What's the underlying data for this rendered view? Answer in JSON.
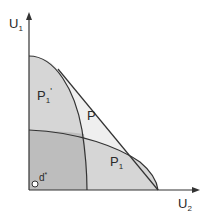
{
  "diagram": {
    "axes": {
      "y_label": "U",
      "y_sub": "1",
      "x_label": "U",
      "x_sub": "2"
    },
    "regions": {
      "p1_prime": {
        "label": "P",
        "sub": "1",
        "sup": "'"
      },
      "p": {
        "label": "P"
      },
      "p1": {
        "label": "P",
        "sub": "1"
      }
    },
    "point": {
      "label": "d",
      "sup": "*"
    },
    "colors": {
      "overlap": "#b9b9b9",
      "single": "#d9d9d9",
      "p_region": "#efefef",
      "lines": "#333333"
    }
  }
}
